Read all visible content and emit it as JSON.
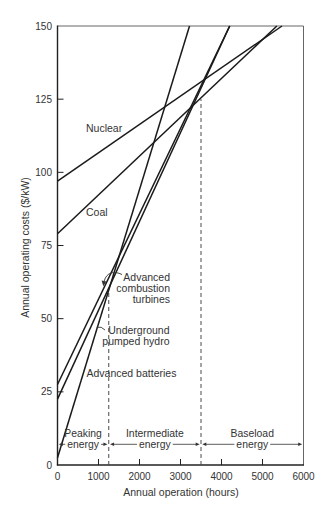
{
  "chart_data": {
    "type": "line",
    "title": "",
    "xlabel": "Annual operation (hours)",
    "ylabel": "Annual operating costs ($/kW)",
    "xlim": [
      0,
      6000
    ],
    "ylim": [
      0,
      150
    ],
    "x_ticks": [
      0,
      1000,
      2000,
      3000,
      4000,
      5000,
      6000
    ],
    "x_tick_labels": [
      "0",
      "1000",
      "2000",
      "3000",
      "4000",
      "5000",
      "6000"
    ],
    "y_ticks": [
      0,
      25,
      50,
      75,
      100,
      125,
      150
    ],
    "y_tick_labels": [
      "0",
      "25",
      "50",
      "75",
      "100",
      "125",
      "150"
    ],
    "grid": false,
    "legend": "none (lines labeled directly)",
    "series": [
      {
        "id": "nuclear",
        "name": "Nuclear",
        "label_lines": [
          "Nuclear"
        ],
        "x": [
          0,
          5475
        ],
        "y": [
          97,
          150
        ]
      },
      {
        "id": "coal",
        "name": "Coal",
        "label_lines": [
          "Coal"
        ],
        "x": [
          0,
          5350
        ],
        "y": [
          79,
          150
        ]
      },
      {
        "id": "turbines",
        "name": "Advanced combustion turbines",
        "label_lines": [
          "Advanced",
          "combustion",
          "turbines"
        ],
        "x": [
          0,
          4200
        ],
        "y": [
          27.5,
          150
        ]
      },
      {
        "id": "hydro",
        "name": "Underground pumped hydro",
        "label_lines": [
          "Underground",
          "pumped hydro"
        ],
        "x": [
          0,
          4200
        ],
        "y": [
          22.5,
          150
        ]
      },
      {
        "id": "batteries",
        "name": "Advanced batteries",
        "label_lines": [
          "Advanced batteries"
        ],
        "x": [
          0,
          3220
        ],
        "y": [
          2.5,
          150
        ]
      }
    ],
    "reference_lines": [
      {
        "id": "peak-intermediate-boundary",
        "x": 1250,
        "y_top": 60,
        "style": "dashed"
      },
      {
        "id": "intermediate-baseload-boundary",
        "x": 3500,
        "y_top": 125,
        "style": "dashed"
      }
    ],
    "regions": [
      {
        "id": "peaking",
        "label_lines": [
          "Peaking",
          "energy"
        ],
        "x_range": [
          0,
          1250
        ]
      },
      {
        "id": "intermediate",
        "label_lines": [
          "Intermediate",
          "energy"
        ],
        "x_range": [
          1250,
          3500
        ]
      },
      {
        "id": "baseload",
        "label_lines": [
          "Baseload",
          "energy"
        ],
        "x_range": [
          3500,
          6000
        ]
      }
    ],
    "colors": {
      "line": "#1a1a1a",
      "axis": "#222222",
      "frame": "#666666",
      "dashed": "#4a4a4a",
      "text": "#333333"
    }
  }
}
